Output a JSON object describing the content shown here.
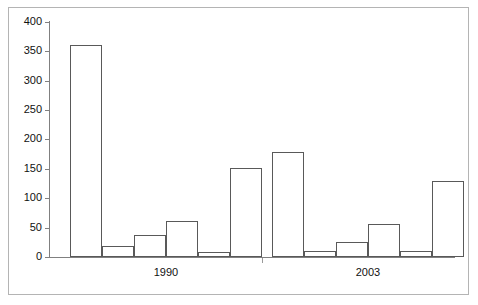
{
  "chart_data": {
    "type": "bar",
    "title": "",
    "subtitle": "",
    "xlabel": "",
    "ylabel": "",
    "categories": [
      "1990",
      "2003"
    ],
    "ylim": [
      0,
      400
    ],
    "y_ticks": [
      0,
      50,
      100,
      150,
      200,
      250,
      300,
      350,
      400
    ],
    "y_tick_labels": [
      "0",
      "50",
      "100",
      "150",
      "200",
      "250",
      "300",
      "350",
      "400"
    ],
    "grid": false,
    "legend": false,
    "legend_position": "none",
    "bar_style": {
      "fill": "#ffffff",
      "edge": "#595959",
      "edge_width": 1
    },
    "groups": [
      {
        "label": "1990",
        "bars": [
          {
            "index": 1,
            "value": 360
          },
          {
            "index": 2,
            "value": 18
          },
          {
            "index": 3,
            "value": 38
          },
          {
            "index": 4,
            "value": 62
          },
          {
            "index": 5,
            "value": 8
          },
          {
            "index": 6,
            "value": 152
          }
        ]
      },
      {
        "label": "2003",
        "bars": [
          {
            "index": 1,
            "value": 178
          },
          {
            "index": 2,
            "value": 10
          },
          {
            "index": 3,
            "value": 25
          },
          {
            "index": 4,
            "value": 56
          },
          {
            "index": 5,
            "value": 10
          },
          {
            "index": 6,
            "value": 130
          }
        ]
      }
    ],
    "values_flat": [
      360,
      18,
      38,
      62,
      8,
      152,
      178,
      10,
      25,
      56,
      10,
      130
    ]
  },
  "axis": {
    "y_labels": [
      "400",
      "350",
      "300",
      "250",
      "200",
      "150",
      "100",
      "50",
      "0"
    ],
    "x_labels": [
      "1990",
      "2003"
    ]
  }
}
